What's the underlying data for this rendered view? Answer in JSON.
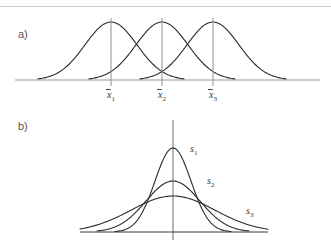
{
  "figure": {
    "background_color": "#ffffff",
    "curve_color": "#2b2b2b",
    "axis_color_a": "#9a9a9a",
    "axis_color_b": "#3a3a3a",
    "text_color": "#555555"
  },
  "panels": [
    {
      "label": "a)",
      "label_x": 18,
      "label_y": 38,
      "description": "Three normal curves with equal spread and different means",
      "baseline": {
        "x1": 15,
        "x2": 320,
        "y": 80
      },
      "curves": [
        {
          "name": "curve-mean-1",
          "peak_x": 111,
          "peak_y": 22,
          "sigma": 26,
          "left_x": 38,
          "right_x": 184
        },
        {
          "name": "curve-mean-2",
          "peak_x": 162,
          "peak_y": 22,
          "sigma": 26,
          "left_x": 89,
          "right_x": 235
        },
        {
          "name": "curve-mean-3",
          "peak_x": 213,
          "peak_y": 22,
          "sigma": 26,
          "left_x": 140,
          "right_x": 286
        }
      ],
      "ticks": [
        {
          "name": "tick-mean-1",
          "x": 111,
          "y_top": 18,
          "y_bottom": 86,
          "label": "x",
          "subscript": "1",
          "label_x": 111,
          "label_y": 98
        },
        {
          "name": "tick-mean-2",
          "x": 162,
          "y_top": 18,
          "y_bottom": 86,
          "label": "x",
          "subscript": "2",
          "label_x": 162,
          "label_y": 98
        },
        {
          "name": "tick-mean-3",
          "x": 213,
          "y_top": 18,
          "y_bottom": 86,
          "label": "x",
          "subscript": "3",
          "label_x": 213,
          "label_y": 98
        }
      ]
    },
    {
      "label": "b)",
      "label_x": 18,
      "label_y": 130,
      "description": "Three normal curves with a common mean and different standard deviations",
      "baseline": {
        "x1": 80,
        "x2": 268,
        "y": 232
      },
      "vertical_axis": {
        "x": 173,
        "y_top": 120,
        "y_bottom": 240
      },
      "curves": [
        {
          "name": "curve-sd-1",
          "peak_x": 173,
          "peak_y": 148,
          "sigma": 18,
          "left_x": 115,
          "right_x": 231,
          "label": "s",
          "subscript": "1",
          "label_x": 190,
          "label_y": 152
        },
        {
          "name": "curve-sd-2",
          "peak_x": 173,
          "peak_y": 181,
          "sigma": 27,
          "left_x": 97,
          "right_x": 249,
          "label": "s",
          "subscript": "2",
          "label_x": 207,
          "label_y": 184
        },
        {
          "name": "curve-sd-3",
          "peak_x": 173,
          "peak_y": 196,
          "sigma": 42,
          "left_x": 80,
          "right_x": 268,
          "label": "s",
          "subscript": "3",
          "label_x": 246,
          "label_y": 214
        }
      ]
    }
  ],
  "chart_data": {
    "type": "line",
    "xlabel": "",
    "ylabel": "",
    "grid": false,
    "legend_position": "inline-annotations",
    "subplots": [
      {
        "panel": "a)",
        "description": "Three normal probability density curves with identical standard deviation but different means",
        "axis": {
          "baseline_only": true,
          "tick_marks": [
            "x̄1",
            "x̄2",
            "x̄3"
          ]
        },
        "series": [
          {
            "name": "x̄1",
            "mean": 111,
            "sd": 26,
            "peak_height": 58
          },
          {
            "name": "x̄2",
            "mean": 162,
            "sd": 26,
            "peak_height": 58
          },
          {
            "name": "x̄3",
            "mean": 213,
            "sd": 26,
            "peak_height": 58
          }
        ]
      },
      {
        "panel": "b)",
        "description": "Three normal probability density curves with identical mean but different standard deviations",
        "axis": {
          "baseline_only": false,
          "vertical_axis_at_mean": true
        },
        "series": [
          {
            "name": "s1",
            "mean": 173,
            "sd": 18,
            "peak_height": 84
          },
          {
            "name": "s2",
            "mean": 173,
            "sd": 27,
            "peak_height": 51
          },
          {
            "name": "s3",
            "mean": 173,
            "sd": 42,
            "peak_height": 36
          }
        ]
      }
    ]
  }
}
